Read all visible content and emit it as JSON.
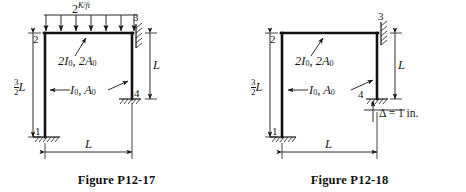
{
  "page": {
    "background_color": "#ffffff",
    "ink_color": "#161616",
    "figure_count": 2
  },
  "figures": [
    {
      "id": "p12-17",
      "caption": "Figure P12-17",
      "load": {
        "magnitude": "2",
        "units": "K/ft",
        "type": "uniformly-distributed",
        "direction": "downward",
        "arrow_count": 7,
        "applied_to": "beam-2-3"
      },
      "members": {
        "beam_label_value": "2",
        "beam_label_inertia": "I",
        "beam_label_inertia_sub": "0",
        "beam_label_sep": ", 2",
        "beam_label_area": "A",
        "beam_label_area_sub": "0",
        "column_label_inertia": "I",
        "column_label_inertia_sub": "0",
        "column_label_sep": ", ",
        "column_label_area": "A",
        "column_label_area_sub": "0"
      },
      "nodes": [
        {
          "id": "1",
          "label": "1",
          "position": "bottom-left",
          "support": "fixed-base"
        },
        {
          "id": "2",
          "label": "2",
          "position": "top-left",
          "support": "none"
        },
        {
          "id": "3",
          "label": "3",
          "position": "top-right",
          "support": "fixed-wall"
        },
        {
          "id": "4",
          "label": "4",
          "position": "mid-right",
          "support": "fixed-base"
        }
      ],
      "dimensions": [
        {
          "name": "left-column-height",
          "num": "3",
          "den": "2",
          "symbol": "L",
          "orientation": "vertical",
          "side": "left"
        },
        {
          "name": "right-column-height",
          "symbol": "L",
          "orientation": "vertical",
          "side": "right"
        },
        {
          "name": "span",
          "symbol": "L",
          "orientation": "horizontal",
          "side": "bottom"
        }
      ]
    },
    {
      "id": "p12-18",
      "caption": "Figure P12-18",
      "load": {
        "type": "support-settlement",
        "symbol": "Δ",
        "equals": "=",
        "value": "1",
        "units": "in.",
        "text": "Δ = 1 in.",
        "direction": "upward",
        "applied_to": "node-4"
      },
      "members": {
        "beam_label_value": "2",
        "beam_label_inertia": "I",
        "beam_label_inertia_sub": "0",
        "beam_label_sep": ", 2",
        "beam_label_area": "A",
        "beam_label_area_sub": "0",
        "column_label_inertia": "I",
        "column_label_inertia_sub": "0",
        "column_label_sep": ", ",
        "column_label_area": "A",
        "column_label_area_sub": "0"
      },
      "nodes": [
        {
          "id": "1",
          "label": "1",
          "position": "bottom-left",
          "support": "fixed-base"
        },
        {
          "id": "2",
          "label": "2",
          "position": "top-left",
          "support": "none"
        },
        {
          "id": "3",
          "label": "3",
          "position": "top-right",
          "support": "fixed-wall"
        },
        {
          "id": "4",
          "label": "4",
          "position": "mid-right",
          "support": "fixed-base-settled"
        }
      ],
      "dimensions": [
        {
          "name": "left-column-height",
          "num": "3",
          "den": "2",
          "symbol": "L",
          "orientation": "vertical",
          "side": "left"
        },
        {
          "name": "right-column-height",
          "symbol": "L",
          "orientation": "vertical",
          "side": "right"
        },
        {
          "name": "span",
          "symbol": "L",
          "orientation": "horizontal",
          "side": "bottom"
        }
      ]
    }
  ]
}
